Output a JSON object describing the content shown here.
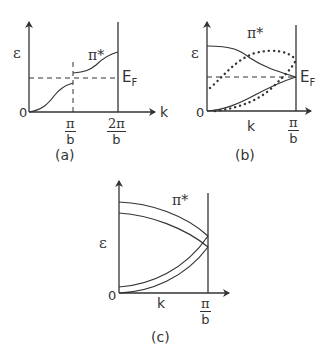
{
  "panels": [
    {
      "id": "a",
      "caption": "(a)",
      "y_label": "ε",
      "x_label": "k",
      "origin": "0",
      "tick1_num": "π",
      "tick1_den": "b",
      "tick2_num": "2π",
      "tick2_den": "b",
      "fermi_label": "E",
      "fermi_sub": "F",
      "band_label": "π*"
    },
    {
      "id": "b",
      "caption": "(b)",
      "y_label": "ε",
      "x_label": "k",
      "origin": "0",
      "tick_num": "π",
      "tick_den": "b",
      "fermi_label": "E",
      "fermi_sub": "F",
      "band_label": "π*"
    },
    {
      "id": "c",
      "caption": "(c)",
      "y_label": "ε",
      "x_label": "k",
      "origin": "0",
      "tick_num": "π",
      "tick_den": "b",
      "band_label": "π*"
    }
  ]
}
